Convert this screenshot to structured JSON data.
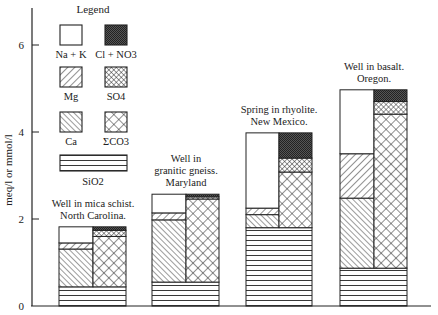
{
  "chart_data": {
    "type": "bar",
    "subtype": "stacked-paired-columns",
    "title": "",
    "xlabel": "",
    "ylabel": "meq/l or mmol/l",
    "ylim": [
      0,
      7
    ],
    "yticks": [
      0,
      2,
      4,
      6
    ],
    "grid": false,
    "legend_position": "upper-left",
    "legend_title": "Legend",
    "legend": [
      {
        "key": "nak",
        "label": "Na + K",
        "pattern": "blank"
      },
      {
        "key": "cl",
        "label": "Cl + NO3",
        "pattern": "dense-dark"
      },
      {
        "key": "mg",
        "label": "Mg",
        "pattern": "diag-wide"
      },
      {
        "key": "so4",
        "label": "SO4",
        "pattern": "fine-crosshatch"
      },
      {
        "key": "ca",
        "label": "Ca",
        "pattern": "diag-narrow"
      },
      {
        "key": "co3",
        "label": "ΣCO3",
        "pattern": "crosshatch"
      },
      {
        "key": "sio2",
        "label": "SiO2",
        "pattern": "horizontal"
      }
    ],
    "categories": [
      "Well in mica schist. North Carolina.",
      "Well in granitic gneiss. Maryland",
      "Spring in rhyolite. New Mexico.",
      "Well in basalt. Oregon."
    ],
    "category_label_lines": [
      [
        "Well in mica schist.",
        "North Carolina."
      ],
      [
        "Well in",
        "granitic gneiss.",
        "Maryland"
      ],
      [
        "Spring in rhyolite.",
        "New Mexico."
      ],
      [
        "Well in basalt.",
        "Oregon."
      ]
    ],
    "series": [
      {
        "name": "SiO2",
        "values": [
          0.44,
          0.55,
          1.8,
          0.87
        ]
      },
      {
        "name": "Ca",
        "values": [
          0.87,
          1.43,
          0.3,
          1.61
        ]
      },
      {
        "name": "Mg",
        "values": [
          0.14,
          0.16,
          0.15,
          1.02
        ]
      },
      {
        "name": "Na + K",
        "values": [
          0.37,
          0.43,
          1.73,
          1.47
        ]
      },
      {
        "name": "ΣCO3",
        "values": [
          1.16,
          1.91,
          1.28,
          3.54
        ]
      },
      {
        "name": "SO4",
        "values": [
          0.14,
          0.05,
          0.32,
          0.29
        ]
      },
      {
        "name": "Cl + NO3",
        "values": [
          0.08,
          0.06,
          0.58,
          0.27
        ]
      }
    ],
    "bar_totals": [
      1.82,
      2.57,
      3.98,
      4.97
    ],
    "stacks": {
      "base": "SiO2 spans full bar width",
      "left_column": [
        "Ca",
        "Mg",
        "Na + K"
      ],
      "right_column": [
        "ΣCO3",
        "SO4",
        "Cl + NO3"
      ]
    }
  }
}
